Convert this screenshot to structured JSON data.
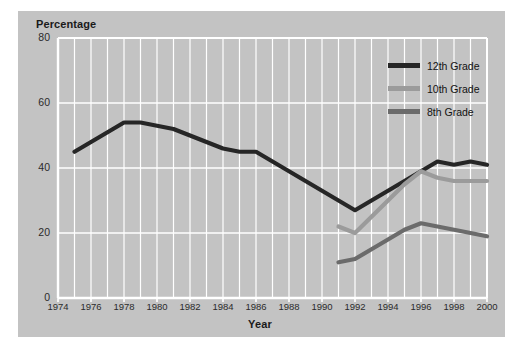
{
  "chart_data": {
    "type": "line",
    "title": "",
    "xlabel": "Year",
    "ylabel": "Percentage",
    "xlim": [
      1974,
      2000
    ],
    "ylim": [
      0,
      80
    ],
    "ytick_labels": [
      "80",
      "60",
      "40",
      "20",
      "0"
    ],
    "yticks": [
      80,
      60,
      40,
      20,
      0
    ],
    "xtick_labels": [
      "1974",
      "1976",
      "1978",
      "1980",
      "1982",
      "1984",
      "1986",
      "1988",
      "1990",
      "1992",
      "1994",
      "1996",
      "1998",
      "2000"
    ],
    "xticks": [
      1974,
      1976,
      1978,
      1980,
      1982,
      1984,
      1986,
      1988,
      1990,
      1992,
      1994,
      1996,
      1998,
      2000
    ],
    "grid": "vertical gridlines every year, horizontal gridlines every 20 units",
    "legend_position": "upper right inside plot",
    "series": [
      {
        "name": "12th Grade",
        "color": "#262626",
        "x": [
          1975,
          1976,
          1977,
          1978,
          1979,
          1980,
          1981,
          1982,
          1983,
          1984,
          1985,
          1986,
          1987,
          1988,
          1989,
          1990,
          1991,
          1992,
          1993,
          1994,
          1995,
          1996,
          1997,
          1998,
          1999,
          2000
        ],
        "values": [
          45,
          48,
          51,
          54,
          54,
          53,
          52,
          50,
          48,
          46,
          45,
          45,
          42,
          39,
          36,
          33,
          30,
          27,
          30,
          33,
          36,
          39,
          42,
          41,
          42,
          41
        ]
      },
      {
        "name": "10th Grade",
        "color": "#9b9b9b",
        "x": [
          1991,
          1992,
          1993,
          1994,
          1995,
          1996,
          1997,
          1998,
          1999,
          2000
        ],
        "values": [
          22,
          20,
          25,
          30,
          35,
          39,
          37,
          36,
          36,
          36
        ]
      },
      {
        "name": "8th Grade",
        "color": "#6b6b6b",
        "x": [
          1991,
          1992,
          1993,
          1994,
          1995,
          1996,
          1997,
          1998,
          1999,
          2000
        ],
        "values": [
          11,
          12,
          15,
          18,
          21,
          23,
          22,
          21,
          20,
          19
        ]
      }
    ],
    "colors": {
      "panel_background": "#c3c3c3",
      "gridline": "#ffffff",
      "axis": "#ffffff",
      "text": "#1a1a1a",
      "figure_background": "#ffffff"
    }
  }
}
